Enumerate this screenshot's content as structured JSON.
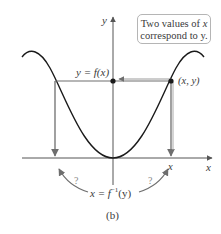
{
  "figure": {
    "caption": "(b)",
    "callout": {
      "line1_prefix": "Two values of ",
      "line1_var": "x",
      "line2": "correspond to y."
    },
    "labels": {
      "y_axis": "y",
      "x_axis": "x",
      "function": "y = f(x)",
      "point": "(x, y)",
      "x_value": "x",
      "inverse": "x = f",
      "inverse_sup": "−1",
      "inverse_arg": "(y)",
      "question_left": "?",
      "question_right": "?"
    },
    "colors": {
      "curve": "#1a1a1a",
      "axes": "#555555",
      "guide_lines": "#6e6e6e",
      "arrows_gray": "#8a8a8a",
      "text": "#3a3a3a"
    }
  }
}
